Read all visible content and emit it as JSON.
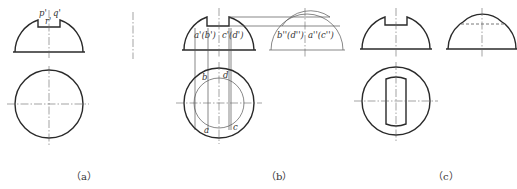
{
  "figures": [
    {
      "id": "a",
      "caption": "（a）",
      "labels": {
        "p": "p'",
        "q": "q'",
        "r": "r'"
      }
    },
    {
      "id": "b",
      "caption": "（b）",
      "front_labels": {
        "left": "a'(b')",
        "right": "c'(d')"
      },
      "side_labels": {
        "left": "b''(d'')",
        "right": "a''(c'')"
      },
      "top_labels": {
        "b": "b",
        "d": "d",
        "a": "a",
        "c": "c"
      }
    },
    {
      "id": "c",
      "caption": "（c）"
    }
  ],
  "colors": {
    "line": "#2a2a2a",
    "thin": "#555555",
    "background": "#ffffff"
  }
}
